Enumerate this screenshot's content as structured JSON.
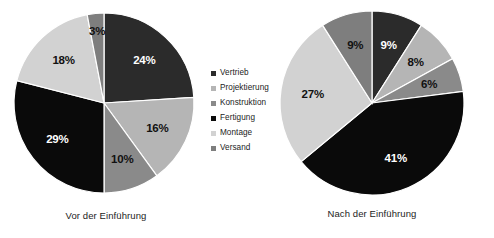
{
  "legend": {
    "position": "center",
    "items": [
      {
        "label": "Vertrieb",
        "color": "#2b2b2b"
      },
      {
        "label": "Projektierung",
        "color": "#b5b5b5"
      },
      {
        "label": "Konstruktion",
        "color": "#8a8a8a"
      },
      {
        "label": "Fertigung",
        "color": "#0a0a0a"
      },
      {
        "label": "Montage",
        "color": "#d2d2d2"
      },
      {
        "label": "Versand",
        "color": "#7e7e7e"
      }
    ]
  },
  "chart_data": [
    {
      "type": "pie",
      "title": "Vor der Einführung",
      "categories": [
        "Vertrieb",
        "Projektierung",
        "Konstruktion",
        "Fertigung",
        "Montage",
        "Versand"
      ],
      "values": [
        24,
        16,
        10,
        29,
        18,
        3
      ],
      "labels": [
        "24%",
        "16%",
        "10%",
        "29%",
        "18%",
        "3%"
      ],
      "colors": [
        "#2b2b2b",
        "#b5b5b5",
        "#8a8a8a",
        "#0a0a0a",
        "#d2d2d2",
        "#7e7e7e"
      ],
      "label_text_colors": [
        "#ffffff",
        "#111111",
        "#111111",
        "#ffffff",
        "#111111",
        "#111111"
      ],
      "start_angle": 0,
      "direction": "clockwise",
      "units": "percent",
      "legend": "shared",
      "xlabel": "",
      "ylabel": ""
    },
    {
      "type": "pie",
      "title": "Nach der Einführung",
      "categories": [
        "Vertrieb",
        "Projektierung",
        "Konstruktion",
        "Fertigung",
        "Montage",
        "Versand"
      ],
      "values": [
        9,
        8,
        6,
        41,
        27,
        9
      ],
      "labels": [
        "9%",
        "8%",
        "6%",
        "41%",
        "27%",
        "9%"
      ],
      "colors": [
        "#2b2b2b",
        "#b5b5b5",
        "#8a8a8a",
        "#0a0a0a",
        "#d2d2d2",
        "#7e7e7e"
      ],
      "label_text_colors": [
        "#ffffff",
        "#111111",
        "#111111",
        "#ffffff",
        "#111111",
        "#111111"
      ],
      "start_angle": 0,
      "direction": "clockwise",
      "units": "percent",
      "legend": "shared",
      "xlabel": "",
      "ylabel": ""
    }
  ]
}
